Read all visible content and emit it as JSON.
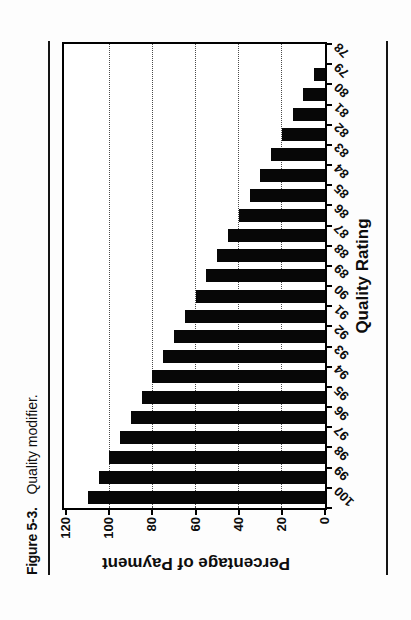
{
  "page": {
    "figure_label": "Figure 5-3.",
    "figure_caption": "Quality modifier."
  },
  "chart_data": {
    "type": "bar",
    "title": "",
    "xlabel": "Quality Rating",
    "ylabel": "Percentage of Payment",
    "categories": [
      100,
      99,
      98,
      97,
      96,
      95,
      94,
      93,
      92,
      91,
      90,
      89,
      88,
      87,
      86,
      85,
      84,
      83,
      82,
      81,
      80,
      79,
      78
    ],
    "values": [
      110,
      105,
      100,
      95,
      90,
      85,
      80,
      75,
      70,
      65,
      60,
      55,
      50,
      45,
      40,
      35,
      30,
      25,
      20,
      15,
      10,
      5,
      0
    ],
    "ylim": [
      0,
      120
    ],
    "yticks": [
      0,
      20,
      40,
      60,
      80,
      100,
      120
    ],
    "gridlines": [
      20,
      40,
      60,
      80,
      100
    ],
    "grid_style": "dotted-horizontal",
    "legend": "none",
    "bar_color": "#070707",
    "page_orientation": "chart rotated 90deg counterclockwise on portrait page"
  }
}
